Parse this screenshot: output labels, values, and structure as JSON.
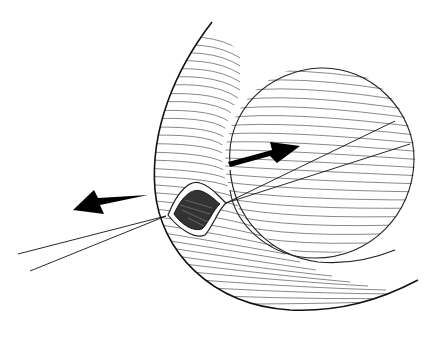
{
  "image": {
    "description": "Black-and-white medical line illustration: curved anatomical wall with hatched tissue, a spherical hatched mass, a small opening with dark interior, two pairs of thin guide lines, and two bold black arrows pointing in opposite directions",
    "colors": {
      "background": "#ffffff",
      "ink": "#111111",
      "hatch": "#555555"
    },
    "arrows": [
      {
        "name": "left-arrow",
        "direction": "left"
      },
      {
        "name": "right-arrow",
        "direction": "up-right"
      }
    ]
  }
}
